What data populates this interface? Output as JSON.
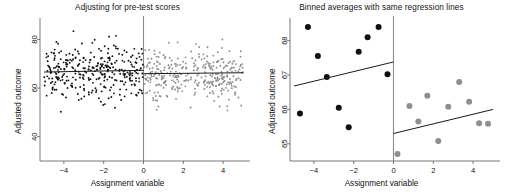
{
  "figure": {
    "width": 509,
    "height": 192,
    "background": "#ffffff",
    "panel_count": 2
  },
  "colors": {
    "treated_points": "#111111",
    "control_points": "#8e8e8e",
    "regression_line": "#1a1a1a",
    "cutoff_line": "#8a8a8a",
    "axis": "#555555",
    "text": "#111111"
  },
  "left_panel": {
    "title": "Adjusting for pre-test scores",
    "xlabel": "Assignment variable",
    "ylabel": "Adjusted outcome"
  },
  "right_panel": {
    "title": "Binned averages with same regression lines",
    "xlabel": "Assignment variable",
    "ylabel": "Adjusted outcome"
  },
  "chart_data": [
    {
      "type": "scatter",
      "panel": "left",
      "title": "Adjusting for pre-test scores",
      "xlabel": "Assignment variable",
      "ylabel": "Adjusted outcome",
      "xlim": [
        -5.2,
        5.2
      ],
      "ylim": [
        30,
        88
      ],
      "xticks": [
        -4,
        -2,
        0,
        2,
        4
      ],
      "yticks": [
        40,
        60,
        80
      ],
      "grid": false,
      "legend": "none",
      "cutoff": 0,
      "annotations": [
        "vertical cutoff line at x = 0"
      ],
      "series": [
        {
          "name": "left of cutoff (dark)",
          "color": "#111111",
          "n_points": 330,
          "x_range": [
            -5.0,
            -0.02
          ],
          "y_mean": 66.6,
          "y_sd": 5.4
        },
        {
          "name": "right of cutoff (gray)",
          "color": "#8e8e8e",
          "n_points": 330,
          "x_range": [
            0.02,
            5.0
          ],
          "y_mean": 66.0,
          "y_sd": 5.4
        }
      ],
      "regression_lines": [
        {
          "side": "left",
          "x0": -5.0,
          "y0": 66.6,
          "x1": 0.0,
          "y1": 67.3
        },
        {
          "side": "right",
          "x0": 0.0,
          "y0": 65.9,
          "x1": 5.0,
          "y1": 66.3
        }
      ]
    },
    {
      "type": "scatter",
      "panel": "right",
      "title": "Binned averages with same regression lines",
      "xlabel": "Assignment variable",
      "ylabel": "Adjusted outcome",
      "xlim": [
        -5.2,
        5.2
      ],
      "ylim": [
        64.5,
        68.6
      ],
      "xticks": [
        -4,
        -2,
        0,
        2,
        4
      ],
      "yticks": [
        65,
        66,
        67,
        68
      ],
      "grid": false,
      "legend": "none",
      "cutoff": 0,
      "annotations": [
        "vertical cutoff line at x = 0"
      ],
      "series": [
        {
          "name": "binned averages left of cutoff",
          "color": "#111111",
          "points": [
            {
              "x": -4.7,
              "y": 65.88
            },
            {
              "x": -4.3,
              "y": 68.4
            },
            {
              "x": -3.8,
              "y": 67.55
            },
            {
              "x": -3.35,
              "y": 66.94
            },
            {
              "x": -2.75,
              "y": 66.05
            },
            {
              "x": -2.25,
              "y": 65.48
            },
            {
              "x": -1.75,
              "y": 67.68
            },
            {
              "x": -1.3,
              "y": 68.1
            },
            {
              "x": -0.75,
              "y": 68.4
            },
            {
              "x": -0.3,
              "y": 67.02
            }
          ]
        },
        {
          "name": "binned averages right of cutoff",
          "color": "#8e8e8e",
          "points": [
            {
              "x": 0.2,
              "y": 64.7
            },
            {
              "x": 0.8,
              "y": 66.1
            },
            {
              "x": 1.25,
              "y": 65.65
            },
            {
              "x": 1.7,
              "y": 66.4
            },
            {
              "x": 2.25,
              "y": 65.08
            },
            {
              "x": 2.75,
              "y": 66.08
            },
            {
              "x": 3.3,
              "y": 66.8
            },
            {
              "x": 3.8,
              "y": 66.22
            },
            {
              "x": 4.3,
              "y": 65.6
            },
            {
              "x": 4.75,
              "y": 65.58
            }
          ]
        }
      ],
      "regression_lines": [
        {
          "side": "left",
          "x0": -5.0,
          "y0": 66.68,
          "x1": 0.0,
          "y1": 67.38
        },
        {
          "side": "right",
          "x0": 0.0,
          "y0": 65.3,
          "x1": 5.0,
          "y1": 66.0
        }
      ]
    }
  ]
}
